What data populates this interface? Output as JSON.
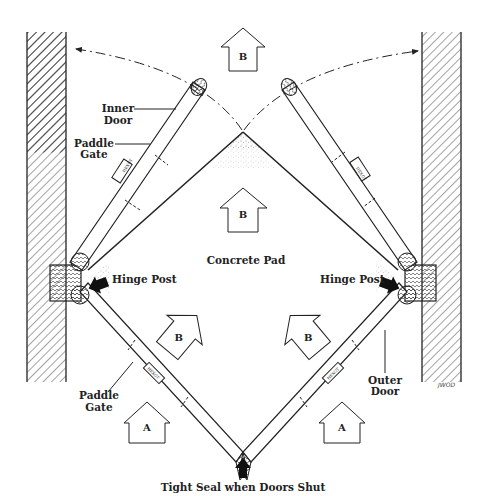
{
  "diagram": {
    "type": "technical illustration",
    "colors": {
      "ink": "#222222",
      "background": "#ffffff",
      "stipple": "#555555"
    }
  },
  "labels": {
    "inner_door": [
      "Inner",
      "Door"
    ],
    "paddle_gate_top": [
      "Paddle",
      "Gate"
    ],
    "hinge_post_left": "Hinge Post",
    "hinge_post_right": "Hinge Post",
    "concrete_pad": "Concrete Pad",
    "paddle_gate_bottom": [
      "Paddle",
      "Gate"
    ],
    "outer_door": [
      "Outer",
      "Door"
    ],
    "tight_seal": "Tight Seal when Doors Shut",
    "signature": "JWOD"
  },
  "flow_arrows": [
    {
      "id": "top",
      "letter": "B"
    },
    {
      "id": "center",
      "letter": "B"
    },
    {
      "id": "lower-left",
      "letter": "B"
    },
    {
      "id": "lower-right",
      "letter": "B"
    },
    {
      "id": "bottom-left",
      "letter": "A"
    },
    {
      "id": "bottom-right",
      "letter": "A"
    }
  ],
  "gate_plates": [
    "HEXGT",
    "HEXGT",
    "HEXGT",
    "HEXGT"
  ]
}
